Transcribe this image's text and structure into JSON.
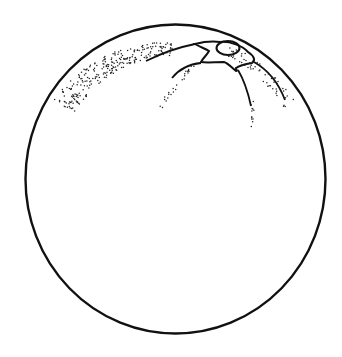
{
  "image": {
    "subject": "orange",
    "style": "black line drawing with stippled shading",
    "colors": {
      "background": "#ffffff",
      "line": "#111111"
    }
  }
}
